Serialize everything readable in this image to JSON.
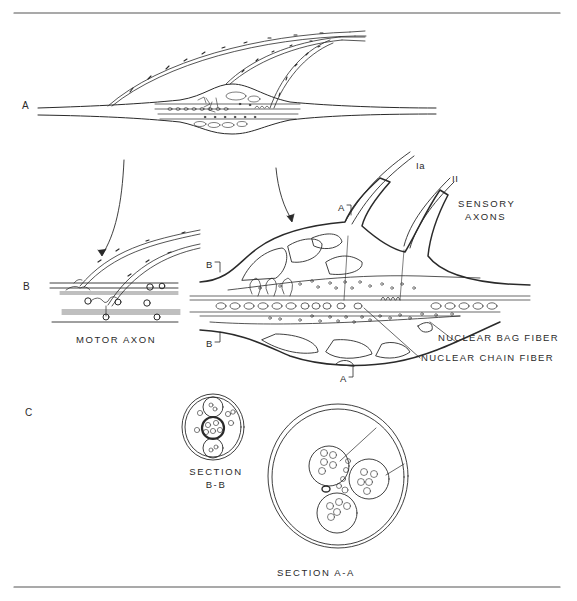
{
  "figure": {
    "panels": [
      {
        "id": "A",
        "label": "A",
        "description": "Overview of muscle spindle with sensory and motor fibers"
      },
      {
        "id": "B",
        "label": "B",
        "description": "Detail of motor endings and spindle equatorial region"
      },
      {
        "id": "C",
        "label": "C",
        "description": "Cross sections of the spindle"
      }
    ],
    "labels": {
      "ia": "Ia",
      "ii": "II",
      "sensory_axons_line1": "SENSORY",
      "sensory_axons_line2": "AXONS",
      "motor_axon": "MOTOR  AXON",
      "nuclear_bag_fiber": "NUCLEAR BAG FIBER",
      "nuclear_chain_fiber": "NUCLEAR CHAIN FIBER",
      "section_marker_a_top": "A",
      "section_marker_a_bottom": "A",
      "section_marker_b_top": "B",
      "section_marker_b_bottom": "B",
      "section_bb_line1": "SECTION",
      "section_bb_line2": "B-B",
      "section_aa": "SECTION  A-A"
    },
    "colors": {
      "ink": "#2a2a2a",
      "background": "#ffffff",
      "rule": "#555555"
    }
  }
}
